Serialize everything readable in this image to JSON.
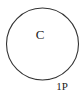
{
  "diagram": {
    "circle": {
      "label": "C",
      "stroke_color": "#333333",
      "cx": 42.5,
      "cy": 44,
      "r": 36
    },
    "point_label": "1P"
  }
}
